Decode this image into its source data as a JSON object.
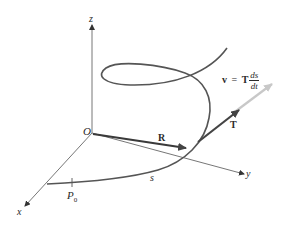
{
  "figure": {
    "axes": {
      "x_label": "x",
      "y_label": "y",
      "z_label": "z",
      "origin_label": "O"
    },
    "vectors": {
      "position_label": "R",
      "tangent_label": "T",
      "velocity_lhs": "v",
      "velocity_eq": "=",
      "velocity_T": "T",
      "velocity_num": "ds",
      "velocity_den": "dt"
    },
    "curve": {
      "arc_length_label": "s",
      "start_point_label": "P",
      "start_point_subscript": "0"
    },
    "colors": {
      "curve": "#555555",
      "axis": "#555555",
      "vector_R": "#3a3a3a",
      "vector_T": "#444444",
      "vector_v": "#c8c8c8",
      "text": "#2a2a2a"
    }
  }
}
